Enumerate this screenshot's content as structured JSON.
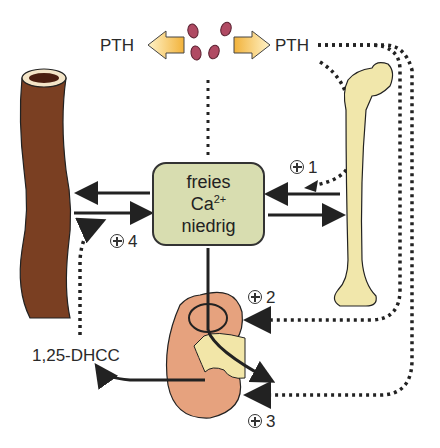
{
  "hormone": {
    "left_label": "PTH",
    "right_label": "PTH"
  },
  "center_box": {
    "line1": "freies",
    "line2_base": "Ca",
    "line2_sup": "2+",
    "line3": "niedrig"
  },
  "effects": [
    {
      "id": "1",
      "label": "1",
      "target": "bone"
    },
    {
      "id": "2",
      "label": "2",
      "target": "kidney-reabsorption"
    },
    {
      "id": "3",
      "label": "3",
      "target": "kidney-calcitriol"
    },
    {
      "id": "4",
      "label": "4",
      "target": "intestine"
    }
  ],
  "metabolite": {
    "label": "1,25-DHCC"
  },
  "colors": {
    "intestine": "#7a3f22",
    "bone": "#f1e7ab",
    "kidney": "#e6a27e",
    "box": "#d8ddb0",
    "pth_dots": "#b04a63",
    "arrow_fill": "#f5c34e"
  }
}
